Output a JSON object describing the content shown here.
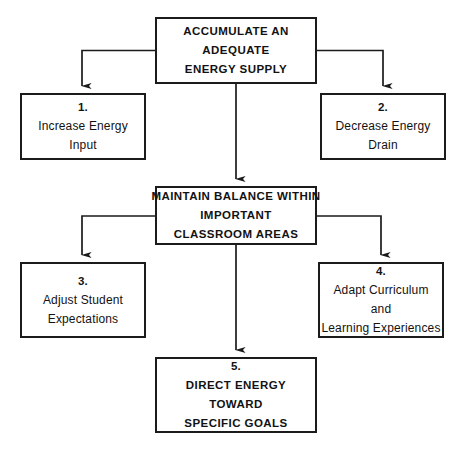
{
  "figure": {
    "background": "#ffffff",
    "stroke_color": "#1b1b1b",
    "text_color": "#121212"
  },
  "nodes": {
    "accumulate": {
      "id": "1-top",
      "style": "uppercase-bold",
      "lines": [
        "ACCUMULATE AN",
        "ADEQUATE",
        "ENERGY SUPPLY"
      ]
    },
    "increase": {
      "id": "step-1",
      "number": "1.",
      "style": "mixed-case",
      "lines": [
        "Increase Energy",
        "Input"
      ]
    },
    "decrease": {
      "id": "step-2",
      "number": "2.",
      "style": "mixed-case",
      "lines": [
        "Decrease Energy",
        "Drain"
      ]
    },
    "maintain": {
      "id": "2-middle",
      "style": "uppercase-bold",
      "lines": [
        "MAINTAIN BALANCE WITHIN",
        "IMPORTANT",
        "CLASSROOM AREAS"
      ]
    },
    "adjust": {
      "id": "step-3",
      "number": "3.",
      "style": "mixed-case",
      "lines": [
        "Adjust Student",
        "Expectations"
      ]
    },
    "adapt": {
      "id": "step-4",
      "number": "4.",
      "style": "mixed-case",
      "lines": [
        "Adapt Curriculum",
        "and",
        "Learning Experiences"
      ]
    },
    "direct": {
      "id": "step-5",
      "number": "5.",
      "style": "uppercase-bold",
      "lines": [
        "DIRECT ENERGY",
        "TOWARD",
        "SPECIFIC GOALS"
      ]
    }
  },
  "connectors": [
    {
      "name": "accumulate-to-increase",
      "from": "accumulate",
      "to": "increase",
      "shape": "elbow-left"
    },
    {
      "name": "accumulate-to-decrease",
      "from": "accumulate",
      "to": "decrease",
      "shape": "elbow-right"
    },
    {
      "name": "accumulate-to-maintain",
      "from": "accumulate",
      "to": "maintain",
      "shape": "vertical"
    },
    {
      "name": "maintain-to-adjust",
      "from": "maintain",
      "to": "adjust",
      "shape": "elbow-left"
    },
    {
      "name": "maintain-to-adapt",
      "from": "maintain",
      "to": "adapt",
      "shape": "elbow-right"
    },
    {
      "name": "maintain-to-direct",
      "from": "maintain",
      "to": "direct",
      "shape": "vertical"
    }
  ]
}
